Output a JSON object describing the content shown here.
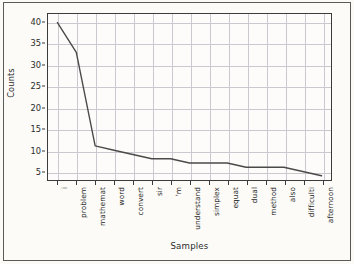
{
  "figure": {
    "background_color": "#fbfaf7",
    "axes_color": "#3b3b3b",
    "grid_color": "#c9c9cf",
    "line_color": "#4a4a4a"
  },
  "chart_data": {
    "type": "line",
    "title": "",
    "xlabel": "Samples",
    "ylabel": "Counts",
    "categories": [
      "i",
      "problem",
      "mathemat",
      "word",
      "convert",
      "sir",
      "'m",
      "understand",
      "simplex",
      "equat",
      "dual",
      "method",
      "also",
      "difficulti",
      "afternoon"
    ],
    "values": [
      40,
      33,
      11,
      10,
      9,
      8,
      8,
      7,
      7,
      7,
      6,
      6,
      6,
      5,
      4
    ],
    "yticks": [
      5,
      10,
      15,
      20,
      25,
      30,
      35,
      40
    ],
    "ytick_labels": [
      "5",
      "10",
      "15",
      "20",
      "25",
      "30",
      "35",
      "40"
    ],
    "ylim": [
      3,
      42
    ],
    "xlim": [
      -0.5,
      14.5
    ],
    "grid": true,
    "legend": null,
    "marker": "none",
    "linewidth": 1.4
  }
}
